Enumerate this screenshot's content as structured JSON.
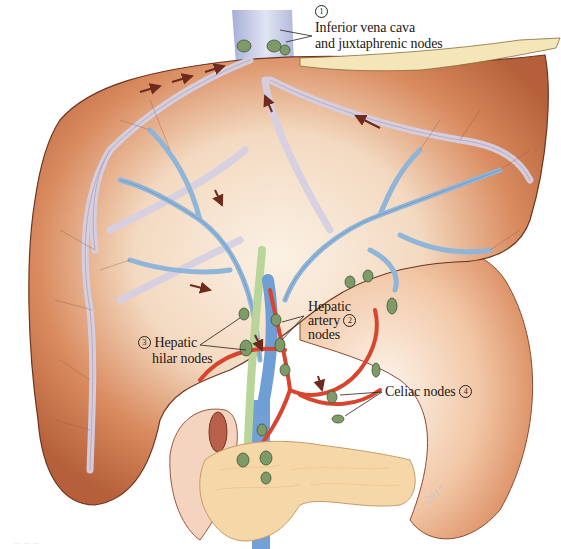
{
  "figure": {
    "colors": {
      "liver_dark": "#b5603a",
      "liver_mid": "#d98a5e",
      "liver_light": "#f6e3cf",
      "vein_blue": "#8fb5d9",
      "vena_cava": "#b9bede",
      "lymph_vessel": "#d9d2e2",
      "artery_red": "#d8452e",
      "bile_duct_green": "#b8d59a",
      "node_green": "#7d9a68",
      "pancreas": "#f6d8a8",
      "arrow": "#6e2a1c"
    }
  },
  "labels": {
    "ivc": {
      "number": "1",
      "line1": "Inferior vena cava",
      "line2": "and juxtaphrenic nodes"
    },
    "hepatic_artery": {
      "number": "2",
      "line1": "Hepatic",
      "line2": "artery",
      "line3": "nodes"
    },
    "hilar": {
      "number": "3",
      "line1": "Hepatic",
      "line2": "hilar nodes"
    },
    "celiac": {
      "number": "4",
      "line1": "Celiac nodes"
    }
  },
  "signature": "~2017",
  "caption": "— — —"
}
